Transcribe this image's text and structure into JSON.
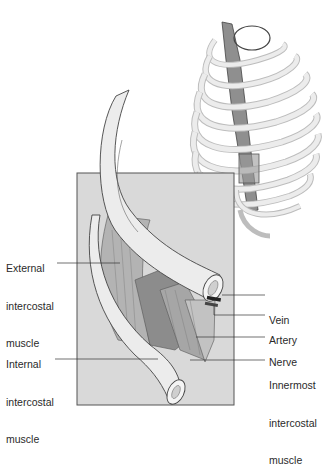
{
  "figure": {
    "colors": {
      "background": "#ffffff",
      "panel": "#d9d9d9",
      "panel_border": "#555555",
      "bone": "#ececec",
      "bone_outline": "#444444",
      "muscle_dark": "#8c8c8c",
      "muscle_mid": "#b3b3b3",
      "leader_line": "#333333",
      "text": "#2a2a2a"
    },
    "labels": {
      "external_intercostal": [
        "External",
        "intercostal",
        "muscle"
      ],
      "internal_intercostal": [
        "Internal",
        "intercostal",
        "muscle"
      ],
      "vein": "Vein",
      "artery": "Artery",
      "nerve": "Nerve",
      "innermost_intercostal": [
        "Innermost",
        "intercostal",
        "muscle"
      ]
    }
  }
}
